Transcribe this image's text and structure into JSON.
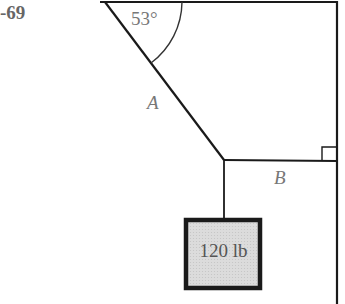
{
  "problem": {
    "number": "-69"
  },
  "diagram": {
    "angle_label": "53°",
    "cable_a_label": "A",
    "cable_b_label": "B",
    "weight_label": "120 lb"
  },
  "colors": {
    "line": "#1a1a1a",
    "label": "#777777",
    "weight_fill": "#d8d8d8"
  }
}
